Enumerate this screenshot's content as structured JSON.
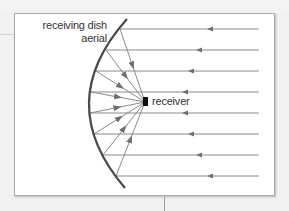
{
  "diagram": {
    "labels": {
      "dish_line1": "receiving dish",
      "dish_line2": "aerial",
      "receiver": "receiver"
    },
    "colors": {
      "line": "#7f7f7f",
      "dish": "#4a4a4a",
      "receiver": "#111111",
      "panel_bg": "#ffffff",
      "page_bg": "#f1f1f1"
    },
    "incoming_ray_count": 8,
    "direction": "right-to-left"
  }
}
